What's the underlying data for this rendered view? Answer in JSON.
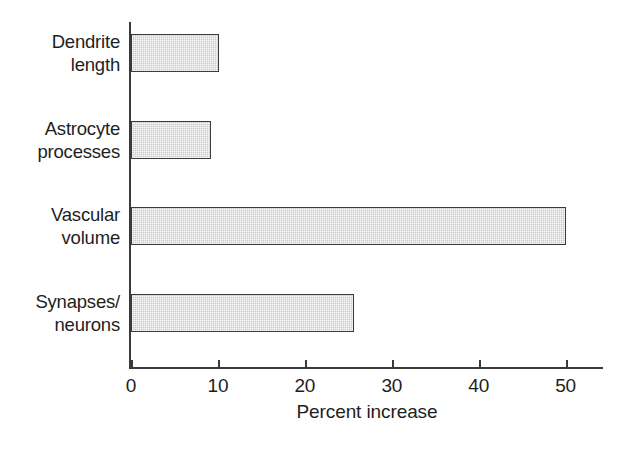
{
  "chart_data": {
    "type": "bar",
    "orientation": "horizontal",
    "title": "",
    "xlabel": "Percent increase",
    "ylabel": "",
    "categories": [
      "Dendrite length",
      "Astrocyte processes",
      "Vascular volume",
      "Synapses/ neurons"
    ],
    "category_lines": [
      [
        "Dendrite",
        "length"
      ],
      [
        "Astrocyte",
        "processes"
      ],
      [
        "Vascular",
        "volume"
      ],
      [
        "Synapses/",
        "neurons"
      ]
    ],
    "values": [
      10.1,
      9.2,
      50,
      25.7
    ],
    "xlim": [
      0,
      54.3
    ],
    "xticks": [
      0,
      10,
      20,
      30,
      40,
      50
    ],
    "xtick_labels": [
      "0",
      "10",
      "20",
      "30",
      "40",
      "50"
    ],
    "grid": false,
    "legend": false,
    "bar_fill_color": "#d2d2d2",
    "bar_border_color": "#3b3b3b",
    "axis_color": "#3a3a3a",
    "background_color": "#ffffff"
  }
}
